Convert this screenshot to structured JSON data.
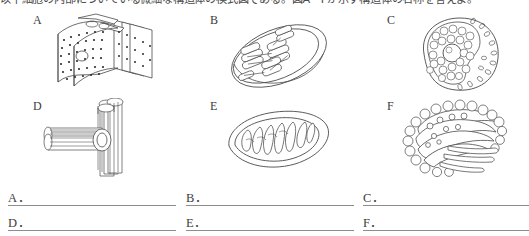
{
  "question": {
    "stem_text": "以下細胞の内部についている微細な構造体の模式図である。図A〜Fが示す構造体の名称を答えよ。"
  },
  "figures": [
    {
      "letter": "A",
      "icon": "rough-endoplasmic-reticulum-diagram"
    },
    {
      "letter": "B",
      "icon": "chloroplast-diagram"
    },
    {
      "letter": "C",
      "icon": "nucleus-diagram"
    },
    {
      "letter": "D",
      "icon": "centriole-diagram"
    },
    {
      "letter": "E",
      "icon": "mitochondrion-diagram"
    },
    {
      "letter": "F",
      "icon": "golgi-apparatus-diagram"
    }
  ],
  "answers": {
    "rows": [
      [
        {
          "label": "A．",
          "value": ""
        },
        {
          "label": "B．",
          "value": ""
        },
        {
          "label": "C．",
          "value": ""
        }
      ],
      [
        {
          "label": "D．",
          "value": ""
        },
        {
          "label": "E．",
          "value": ""
        },
        {
          "label": "F．",
          "value": ""
        }
      ]
    ]
  },
  "colors": {
    "ink": "#3a3a3a",
    "line": "#8d8d8d",
    "background": "#ffffff"
  }
}
